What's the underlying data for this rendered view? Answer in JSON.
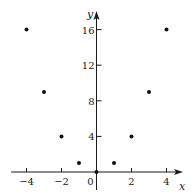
{
  "chart_data": {
    "type": "scatter",
    "title": "",
    "xlabel": "x",
    "ylabel": "y",
    "x": [
      -4,
      -3,
      -2,
      -1,
      0,
      1,
      2,
      3,
      4
    ],
    "y": [
      16,
      9,
      4,
      1,
      0,
      1,
      4,
      9,
      16
    ],
    "xlim": [
      -5,
      5
    ],
    "ylim": [
      -2,
      19
    ],
    "xticks": [
      -4,
      -2,
      0,
      2,
      4
    ],
    "xtick_labels": [
      "−4",
      "−2",
      "0",
      "2",
      "4"
    ],
    "yticks": [
      4,
      8,
      12,
      16
    ],
    "ytick_labels": [
      "4",
      "8",
      "12",
      "16"
    ],
    "grid": false,
    "legend": null,
    "point_color": "#111111",
    "axis_color": "#1a1a1a"
  }
}
